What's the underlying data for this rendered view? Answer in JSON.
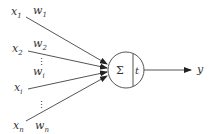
{
  "diagram": {
    "inputs": [
      {
        "id": "x1",
        "label": "x",
        "sub": "1",
        "weight": "w",
        "weight_sub": "1"
      },
      {
        "id": "x2",
        "label": "x",
        "sub": "2",
        "weight": "w",
        "weight_sub": "2"
      },
      {
        "id": "xi",
        "label": "x",
        "sub": "i",
        "weight": "w",
        "weight_sub": "i"
      },
      {
        "id": "xn",
        "label": "x",
        "sub": "n",
        "weight": "w",
        "weight_sub": "n"
      }
    ],
    "ellipsis": "⋮",
    "node": {
      "sum_symbol": "Σ",
      "threshold_label": "t"
    },
    "output": {
      "label": "y"
    },
    "colors": {
      "stroke": "#444444",
      "text": "#333333",
      "background": "#ffffff"
    }
  }
}
